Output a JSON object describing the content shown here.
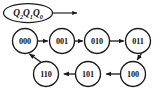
{
  "diagram": {
    "kind": "state-transition-diagram",
    "background_color": "#ffffff",
    "stroke_color": "#1a1a1a",
    "text_color": "#111111",
    "register_label": {
      "name": "state-register-label",
      "base_1": "Q",
      "sub_1": "2",
      "base_2": "Q",
      "sub_2": "1",
      "base_3": "Q",
      "sub_3": "0",
      "full_text": "Q2Q1Q0"
    },
    "nodes": [
      {
        "id": "s000",
        "label": "000",
        "cx": 25,
        "cy": 41,
        "r": 12.5
      },
      {
        "id": "s001",
        "label": "001",
        "cx": 62,
        "cy": 41,
        "r": 12.5
      },
      {
        "id": "s010",
        "label": "010",
        "cx": 97,
        "cy": 41,
        "r": 12.5
      },
      {
        "id": "s011",
        "label": "011",
        "cx": 138,
        "cy": 41,
        "r": 12.5
      },
      {
        "id": "s100",
        "label": "100",
        "cx": 133,
        "cy": 74,
        "r": 12.5
      },
      {
        "id": "s101",
        "label": "101",
        "cx": 88,
        "cy": 74,
        "r": 12.5
      },
      {
        "id": "s110",
        "label": "110",
        "cx": 46,
        "cy": 74,
        "r": 12.5
      }
    ],
    "edges": [
      {
        "id": "e-000-001",
        "from": "000",
        "to": "001",
        "direction": "right"
      },
      {
        "id": "e-001-010",
        "from": "001",
        "to": "010",
        "direction": "right"
      },
      {
        "id": "e-010-011",
        "from": "010",
        "to": "011",
        "direction": "right"
      },
      {
        "id": "e-011-100",
        "from": "011",
        "to": "100",
        "direction": "down-left"
      },
      {
        "id": "e-100-101",
        "from": "100",
        "to": "101",
        "direction": "left"
      },
      {
        "id": "e-101-110",
        "from": "101",
        "to": "110",
        "direction": "left"
      },
      {
        "id": "e-110-000",
        "from": "110",
        "to": "000",
        "direction": "up-left"
      }
    ],
    "pointer": {
      "name": "register-pointer-arrow",
      "from_x": 52,
      "from_y": 13,
      "to_x": 78,
      "to_y": 13
    }
  }
}
